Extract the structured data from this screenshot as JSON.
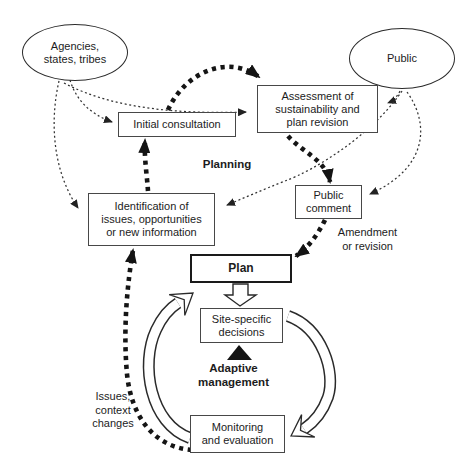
{
  "nodes": {
    "agencies": {
      "lines": [
        "Agencies,",
        "states, tribes"
      ]
    },
    "public": {
      "label": "Public"
    },
    "initial_consultation": {
      "label": "Initial consultation"
    },
    "assessment": {
      "lines": [
        "Assessment of",
        "sustainability and",
        "plan revision"
      ]
    },
    "public_comment": {
      "lines": [
        "Public",
        "comment"
      ]
    },
    "identification": {
      "lines": [
        "Identification of",
        "issues, opportunities",
        "or new information"
      ]
    },
    "plan": {
      "label": "Plan"
    },
    "site_specific": {
      "lines": [
        "Site-specific",
        "decisions"
      ]
    },
    "monitoring": {
      "lines": [
        "Monitoring",
        "and evaluation"
      ]
    }
  },
  "labels": {
    "planning": "Planning",
    "amendment": {
      "lines": [
        "Amendment",
        "or revision"
      ]
    },
    "adaptive": {
      "lines": [
        "Adaptive",
        "management"
      ]
    },
    "issues": {
      "lines": [
        "Issues,",
        "context",
        "changes"
      ]
    }
  },
  "colors": {
    "ink": "#1c1c1c",
    "background": "#ffffff"
  },
  "connectors": [
    {
      "from": "agencies",
      "to": "initial_consultation",
      "style": "thin-dotted"
    },
    {
      "from": "agencies",
      "to": "assessment",
      "style": "thin-dotted"
    },
    {
      "from": "agencies",
      "to": "identification",
      "style": "thin-dotted"
    },
    {
      "from": "public",
      "to": "assessment",
      "style": "thin-dotted"
    },
    {
      "from": "public",
      "to": "public_comment",
      "style": "thin-dotted"
    },
    {
      "from": "public",
      "to": "identification",
      "style": "thin-dotted"
    },
    {
      "from": "identification",
      "to": "initial_consultation",
      "style": "thick-dotted"
    },
    {
      "from": "initial_consultation",
      "to": "assessment",
      "style": "thick-dotted"
    },
    {
      "from": "assessment",
      "to": "public_comment",
      "style": "thick-dotted"
    },
    {
      "from": "public_comment",
      "to": "plan",
      "style": "thick-dotted"
    },
    {
      "from": "monitoring",
      "to": "identification",
      "style": "thick-dotted"
    },
    {
      "from": "plan",
      "to": "site_specific",
      "style": "hollow-block-arrow"
    },
    {
      "from": "monitoring",
      "to": "site_specific",
      "style": "hollow-curved-arrow"
    },
    {
      "from": "site_specific",
      "to": "monitoring",
      "style": "hollow-curved-arrow"
    }
  ]
}
